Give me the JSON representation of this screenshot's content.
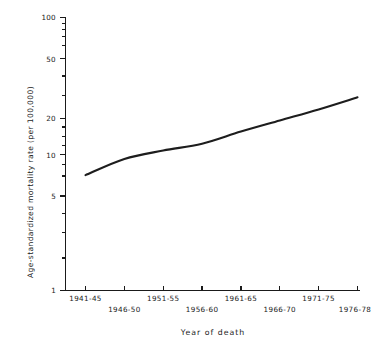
{
  "chart_data": {
    "type": "line",
    "title": "",
    "xlabel": "Year of death",
    "ylabel": "Age-standardized mortality rate (per 100,000)",
    "yscale": "log",
    "ylim": [
      1,
      100
    ],
    "grid": false,
    "legend": null,
    "ytick_labels": [
      "100",
      "50",
      "20",
      "10",
      "5",
      "1"
    ],
    "ytick_values": [
      100,
      50,
      20,
      10,
      5,
      1
    ],
    "yminor_values": [
      90,
      80,
      70,
      60,
      40,
      30,
      9,
      8,
      7,
      6,
      4,
      3,
      2
    ],
    "categories": [
      "1941-45",
      "1946-50",
      "1951-55",
      "1956-60",
      "1961-65",
      "1966-70",
      "1971-75",
      "1976-78"
    ],
    "values": [
      7.0,
      9.2,
      10.6,
      11.9,
      14.6,
      17.6,
      21.2,
      26.0
    ],
    "series": [
      {
        "name": "Age-standardized mortality rate",
        "values": [
          7.0,
          9.2,
          10.6,
          11.9,
          14.6,
          17.6,
          21.2,
          26.0
        ]
      }
    ]
  },
  "axes": {
    "y_axis_title": "Age-standardized mortality rate (per 100,000)",
    "x_axis_title": "Year of death"
  }
}
